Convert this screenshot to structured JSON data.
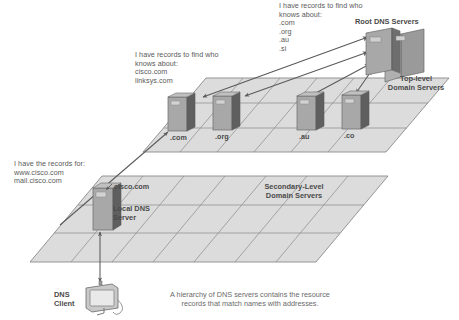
{
  "diagram": {
    "caption": "A hierarchy of DNS servers contains the resource\nrecords that match names with addresses.",
    "colors": {
      "plane_fill": "#dcdcdc",
      "plane_stroke": "#8a8a8a",
      "server_body": "#a8a8a8",
      "server_side": "#6e6e6e",
      "server_top": "#c4c4c4",
      "arrow": "#5a5a5a",
      "text": "#5a5a5a",
      "label_text": "#4a4a4a"
    },
    "annotations": [
      {
        "id": "root-records-note",
        "text": "I have records to find who\nknows about:\n.com\n.org\n.au\n.si"
      },
      {
        "id": "tld-records-note",
        "text": "I have records to find who\nknows about:\ncisco.com\nlinksys.com"
      },
      {
        "id": "local-records-note",
        "text": "I have the records for:\nwww.cisco.com\nmail.cisco.com"
      }
    ],
    "tier_labels": [
      {
        "id": "root-dns-servers",
        "text": "Root DNS Servers"
      },
      {
        "id": "top-level-domain-servers",
        "text": "Top-level\nDomain Servers"
      },
      {
        "id": "secondary-level-domain-servers",
        "text": "Secondary-Level\nDomain Servers"
      },
      {
        "id": "local-dns-server",
        "text": "Local DNS\nServer"
      },
      {
        "id": "dns-client",
        "text": "DNS\nClient"
      }
    ],
    "tld_servers": [
      {
        "id": "tld-com",
        "label": ".com"
      },
      {
        "id": "tld-org",
        "label": ".org"
      },
      {
        "id": "tld-au",
        "label": ".au"
      },
      {
        "id": "tld-co",
        "label": ".co"
      }
    ],
    "secondary_servers": [
      {
        "id": "secondary-cisco",
        "label": "cisco.com"
      }
    ]
  }
}
